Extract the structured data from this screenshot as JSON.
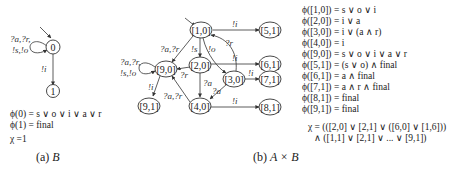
{
  "diagram_a": {
    "nodes": [
      {
        "id": "0",
        "label": "0",
        "initial": true
      },
      {
        "id": "1",
        "label": "1"
      }
    ],
    "edges": [
      {
        "from": "0",
        "to": "0",
        "label_line1": "?a,?r,",
        "label_line2": "!s,!o",
        "type": "self-loop"
      },
      {
        "from": "0",
        "to": "1",
        "label": "!i"
      }
    ],
    "formulas": [
      "ϕ(0) = s ∨ o ∨ i ∨ a ∨ r",
      "ϕ(1) = final"
    ],
    "chi": "χ =1",
    "caption_prefix": "(a)",
    "caption_var": "B"
  },
  "diagram_b": {
    "nodes": [
      {
        "id": "1,0",
        "label": "[1,0]",
        "initial": true
      },
      {
        "id": "2,0",
        "label": "[2,0]"
      },
      {
        "id": "3,0",
        "label": "[3,0]"
      },
      {
        "id": "4,0",
        "label": "[4,0]"
      },
      {
        "id": "9,0",
        "label": "[9,0]"
      },
      {
        "id": "9,1",
        "label": "[9,1]"
      },
      {
        "id": "5,1",
        "label": "[5,1]"
      },
      {
        "id": "6,1",
        "label": "[6,1]"
      },
      {
        "id": "7,1",
        "label": "[7,1]"
      },
      {
        "id": "8,1",
        "label": "[8,1]"
      }
    ],
    "edges": [
      {
        "from": "1,0",
        "to": "5,1",
        "label": "!i"
      },
      {
        "from": "1,0",
        "to": "2,0",
        "label": "!s"
      },
      {
        "from": "1,0",
        "to": "3,0",
        "label": "!o"
      },
      {
        "from": "3,0",
        "to": "1,0",
        "label": "?r"
      },
      {
        "from": "1,0",
        "to": "9,0",
        "label": "?a,?r"
      },
      {
        "from": "2,0",
        "to": "9,0",
        "label": "?r"
      },
      {
        "from": "2,0",
        "to": "6,1",
        "label": "!i"
      },
      {
        "from": "2,0",
        "to": "4,0",
        "label": "?a"
      },
      {
        "from": "3,0",
        "to": "4,0",
        "label": "?a"
      },
      {
        "from": "3,0",
        "to": "7,1",
        "label": "!i"
      },
      {
        "from": "4,0",
        "to": "8,1",
        "label": "!i"
      },
      {
        "from": "4,0",
        "to": "9,0",
        "label": "?a,?r"
      },
      {
        "from": "9,0",
        "to": "9,0",
        "label_line1": "?a,?r,",
        "label_line2": "!s,!o",
        "type": "self-loop"
      },
      {
        "from": "9,0",
        "to": "9,1",
        "label": "!i"
      }
    ],
    "formulas": [
      "ϕ([1,0]) = s ∨ o ∨ i",
      "ϕ([2,0]) = i ∨ a",
      "ϕ([3,0]) = i ∨ (a ∧ r)",
      "ϕ([4,0]) = i",
      "ϕ([9,0]) = s ∨ o ∨ i ∨ a ∨ r",
      "ϕ([5,1]) = (s ∨ o) ∧  final",
      "ϕ([6,1]) = a  ∧  final",
      "ϕ([7,1]) = a ∧ r  ∧  final",
      "ϕ([8,1]) =  final",
      "ϕ([9,1]) =  final"
    ],
    "chi_line1": "χ = (([2,0] ∨ [2,1] ∨ ([6,0] ∨ [1,6]))",
    "chi_line2": "∧ ([1,1] ∨ [2,1] ∨ ... ∨ [9,1])",
    "caption_prefix": "(b)",
    "caption_var": "A × B"
  }
}
